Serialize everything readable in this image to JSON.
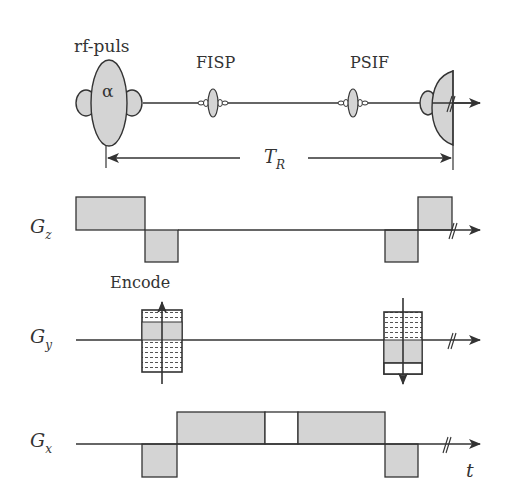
{
  "diagram": {
    "colors": {
      "line": "#333333",
      "fill": "#d4d4d4",
      "background": "#ffffff"
    },
    "rf": {
      "label": "rf-puls",
      "flip_angle": "α",
      "echo_labels": [
        "FISP",
        "PSIF"
      ]
    },
    "tr": {
      "label": "T",
      "subscript": "R"
    },
    "axes": [
      {
        "id": "gz",
        "label": "G",
        "subscript": "z"
      },
      {
        "id": "gy",
        "label": "G",
        "subscript": "y"
      },
      {
        "id": "gx",
        "label": "G",
        "subscript": "x"
      }
    ],
    "encode_label": "Encode",
    "time_label": "t"
  }
}
